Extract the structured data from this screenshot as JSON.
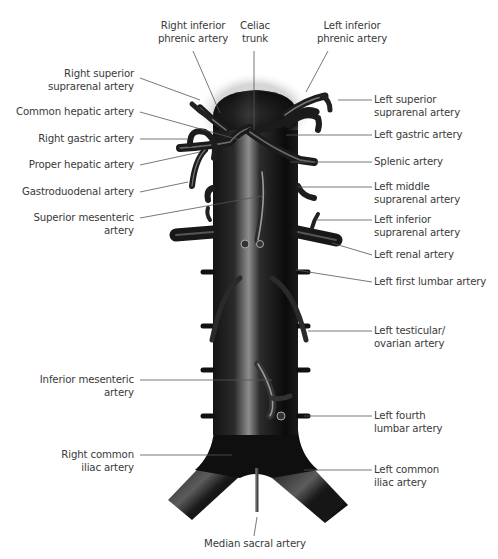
{
  "figure": {
    "colors": {
      "vessel_dark": "#0d0d0d",
      "vessel_mid": "#3a3a3a",
      "vessel_highlight": "#9a9a9a",
      "leader_line": "#555555",
      "text": "#3a3a3a"
    }
  },
  "labels": {
    "right_inferior_phrenic": {
      "line1": "Right inferior",
      "line2": "phrenic artery"
    },
    "celiac_trunk": {
      "line1": "Celiac",
      "line2": "trunk"
    },
    "left_inferior_phrenic": {
      "line1": "Left inferior",
      "line2": "phrenic artery"
    },
    "right_superior_suprarenal": {
      "line1": "Right superior",
      "line2": "suprarenal artery"
    },
    "common_hepatic": {
      "line1": "Common hepatic artery"
    },
    "right_gastric": {
      "line1": "Right gastric artery"
    },
    "proper_hepatic": {
      "line1": "Proper hepatic artery"
    },
    "gastroduodenal": {
      "line1": "Gastroduodenal artery"
    },
    "superior_mesenteric": {
      "line1": "Superior mesenteric",
      "line2": "artery"
    },
    "left_superior_suprarenal": {
      "line1": "Left superior",
      "line2": "suprarenal artery"
    },
    "left_gastric": {
      "line1": "Left gastric artery"
    },
    "splenic": {
      "line1": "Splenic artery"
    },
    "left_middle_suprarenal": {
      "line1": "Left middle",
      "line2": "suprarenal artery"
    },
    "left_inferior_suprarenal": {
      "line1": "Left inferior",
      "line2": "suprarenal artery"
    },
    "left_renal": {
      "line1": "Left renal artery"
    },
    "left_first_lumbar": {
      "line1": "Left first lumbar artery"
    },
    "left_testicular_ovarian": {
      "line1": "Left testicular/",
      "line2": "ovarian artery"
    },
    "inferior_mesenteric": {
      "line1": "Inferior mesenteric",
      "line2": "artery"
    },
    "left_fourth_lumbar": {
      "line1": "Left fourth",
      "line2": "lumbar artery"
    },
    "right_common_iliac": {
      "line1": "Right common",
      "line2": "iliac artery"
    },
    "left_common_iliac": {
      "line1": "Left common",
      "line2": "iliac artery"
    },
    "median_sacral": {
      "line1": "Median sacral artery"
    }
  }
}
